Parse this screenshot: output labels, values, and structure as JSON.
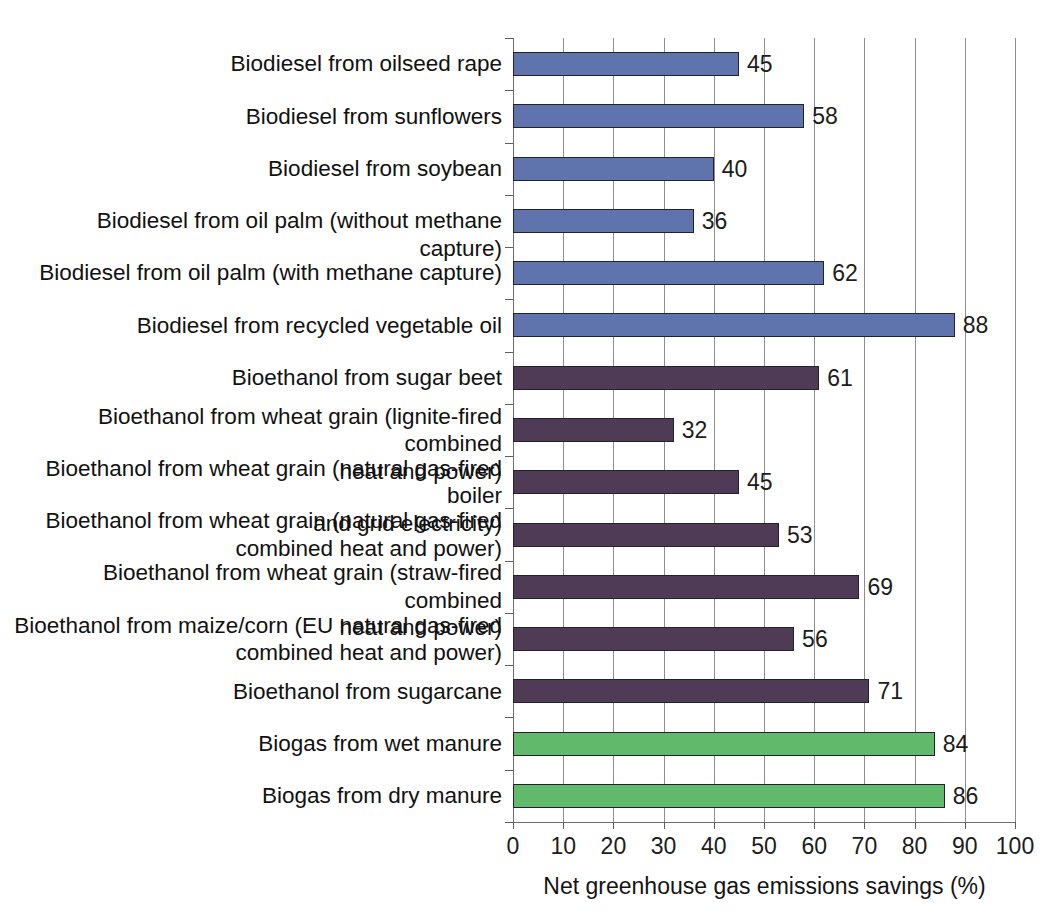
{
  "chart_data": {
    "type": "bar",
    "orientation": "horizontal",
    "title": "",
    "xlabel": "Net greenhouse gas emissions savings (%)",
    "ylabel": "",
    "xlim": [
      0,
      100
    ],
    "xticks": [
      0,
      10,
      20,
      30,
      40,
      50,
      60,
      70,
      80,
      90,
      100
    ],
    "grid": "vertical",
    "legend": "none",
    "categories": [
      "Biodiesel from oilseed rape",
      "Biodiesel from sunflowers",
      "Biodiesel from soybean",
      "Biodiesel from oil palm (without methane capture)",
      "Biodiesel from oil palm (with methane capture)",
      "Biodiesel from recycled vegetable oil",
      "Bioethanol from sugar beet",
      "Bioethanol from wheat grain (lignite-fired combined\nheat and power)",
      "Bioethanol from wheat grain (natural gas-fired boiler\nand grid electricity)",
      "Bioethanol from wheat grain (natural gas-fired\ncombined heat and power)",
      "Bioethanol from wheat grain (straw-fired combined\nheat and power)",
      "Bioethanol from maize/corn (EU natural gas-fired\ncombined heat and power)",
      "Bioethanol from sugarcane",
      "Biogas from wet manure",
      "Biogas from dry manure"
    ],
    "values": [
      45,
      58,
      40,
      36,
      62,
      88,
      61,
      32,
      45,
      53,
      69,
      56,
      71,
      84,
      86
    ],
    "group_colors": {
      "biodiesel": "#5f74ad",
      "bioethanol": "#4f3b55",
      "biogas": "#61ba6b"
    },
    "groups": [
      "biodiesel",
      "biodiesel",
      "biodiesel",
      "biodiesel",
      "biodiesel",
      "biodiesel",
      "bioethanol",
      "bioethanol",
      "bioethanol",
      "bioethanol",
      "bioethanol",
      "bioethanol",
      "bioethanol",
      "biogas",
      "biogas"
    ],
    "bars": [
      {
        "label": "Biodiesel from oilseed rape",
        "value": 45,
        "value_text": "45",
        "group": "biodiesel"
      },
      {
        "label": "Biodiesel from sunflowers",
        "value": 58,
        "value_text": "58",
        "group": "biodiesel"
      },
      {
        "label": "Biodiesel from soybean",
        "value": 40,
        "value_text": "40",
        "group": "biodiesel"
      },
      {
        "label": "Biodiesel from oil palm (without methane capture)",
        "value": 36,
        "value_text": "36",
        "group": "biodiesel"
      },
      {
        "label": "Biodiesel from oil palm (with methane capture)",
        "value": 62,
        "value_text": "62",
        "group": "biodiesel"
      },
      {
        "label": "Biodiesel from recycled vegetable oil",
        "value": 88,
        "value_text": "88",
        "group": "biodiesel"
      },
      {
        "label": "Bioethanol from sugar beet",
        "value": 61,
        "value_text": "61",
        "group": "bioethanol"
      },
      {
        "label": "Bioethanol from wheat grain (lignite-fired combined\nheat and power)",
        "value": 32,
        "value_text": "32",
        "group": "bioethanol"
      },
      {
        "label": "Bioethanol from wheat grain (natural gas-fired boiler\nand grid electricity)",
        "value": 45,
        "value_text": "45",
        "group": "bioethanol"
      },
      {
        "label": "Bioethanol from wheat grain (natural gas-fired\ncombined heat and power)",
        "value": 53,
        "value_text": "53",
        "group": "bioethanol"
      },
      {
        "label": "Bioethanol from wheat grain (straw-fired combined\nheat and power)",
        "value": 69,
        "value_text": "69",
        "group": "bioethanol"
      },
      {
        "label": "Bioethanol from maize/corn (EU natural gas-fired\ncombined heat and power)",
        "value": 56,
        "value_text": "56",
        "group": "bioethanol"
      },
      {
        "label": "Bioethanol from sugarcane",
        "value": 71,
        "value_text": "71",
        "group": "bioethanol"
      },
      {
        "label": "Biogas from wet manure",
        "value": 84,
        "value_text": "84",
        "group": "biogas"
      },
      {
        "label": "Biogas from dry manure",
        "value": 86,
        "value_text": "86",
        "group": "biogas"
      }
    ],
    "xtick_labels": [
      "0",
      "10",
      "20",
      "30",
      "40",
      "50",
      "60",
      "70",
      "80",
      "90",
      "100"
    ]
  }
}
